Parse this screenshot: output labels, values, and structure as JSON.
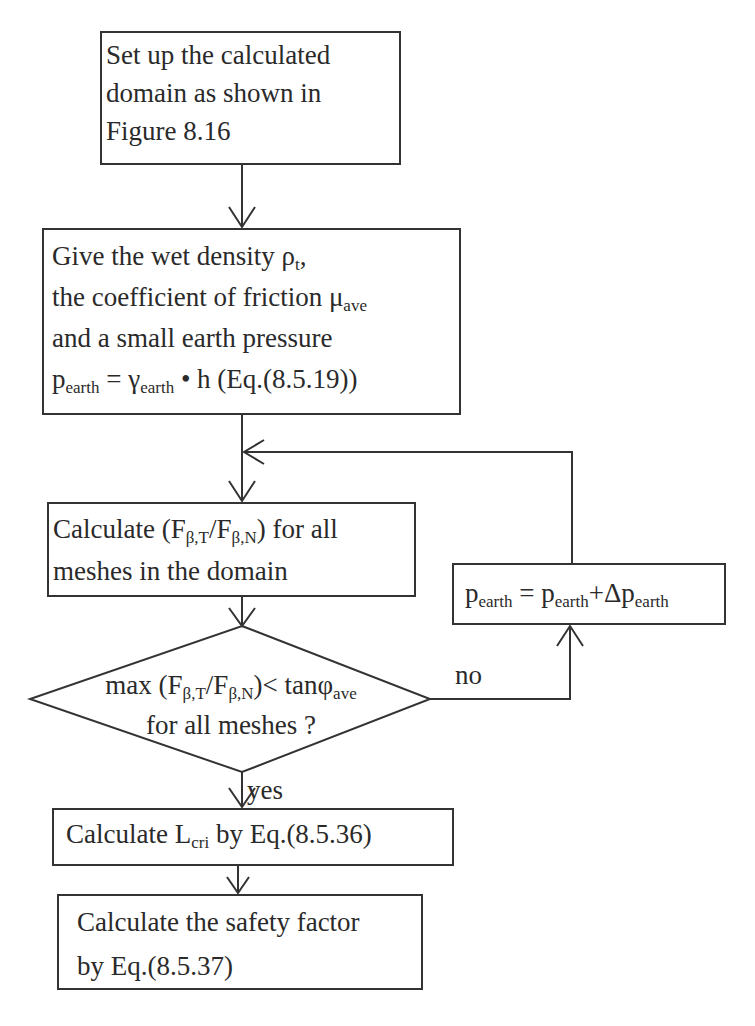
{
  "figure": {
    "type": "flowchart",
    "nodes": {
      "setup": {
        "lines": [
          "Set  up the calculated",
          "domain as shown in",
          "Figure 8.16"
        ]
      },
      "input": {
        "line1_text": "Give the wet density ρ",
        "line1_sub": "t",
        "line1_tail": ",",
        "line2_text": "the coefficient of friction  μ",
        "line2_sub": "ave",
        "line3_text": "and a small earth pressure",
        "line4_p": "p",
        "line4_p_sub": "earth",
        "line4_eq": " = γ",
        "line4_gamma_sub": "earth",
        "line4_tail": " • h (Eq.(8.5.19))"
      },
      "calc_ratio": {
        "line1_a": "Calculate (F",
        "line1_sub1": "β,T",
        "line1_b": "/F",
        "line1_sub2": "β,N",
        "line1_c": ") for all",
        "line2": "meshes in the domain"
      },
      "update_pressure": {
        "p1": "p",
        "s1": "earth",
        "eq": " = p",
        "s2": "earth",
        "plus": "+Δp",
        "s3": "earth"
      },
      "decision": {
        "line1_a": "max (F",
        "line1_sub1": "β,T",
        "line1_b": "/F",
        "line1_sub2": "β,N",
        "line1_c": ")< tanφ",
        "line1_sub3": "ave",
        "line2": "for all meshes ?"
      },
      "calc_lcri": {
        "a": "Calculate L",
        "sub": "cri",
        "b": " by Eq.(8.5.36)"
      },
      "safety": {
        "line1": "Calculate the safety factor",
        "line2": "by Eq.(8.5.37)"
      }
    },
    "edge_labels": {
      "no": "no",
      "yes": "yes"
    },
    "colors": {
      "stroke": "#333333",
      "text": "#2a2a2a",
      "background": "#ffffff"
    }
  }
}
